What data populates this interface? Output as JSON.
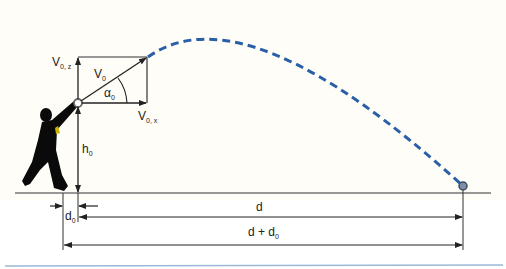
{
  "diagram": {
    "type": "projectile-motion",
    "labels": {
      "v0": "V",
      "v0_sub": "0",
      "v0z": "V",
      "v0z_sub": "0, z",
      "v0x": "V",
      "v0x_sub": "0, x",
      "alpha": "α",
      "alpha_sub": "0",
      "h0": "h",
      "h0_sub": "0",
      "d0": "d",
      "d0_sub": "0",
      "d": "d",
      "d_plus_d0": "d + d",
      "d_plus_d0_sub": "0"
    },
    "colors": {
      "trajectory": "#2a5fa8",
      "lines": "#222222",
      "silhouette": "#0a0a0a",
      "accent_yellow": "#c8b400",
      "background": "#fffdf8",
      "bottom_rule": "#9ab8d8"
    }
  }
}
